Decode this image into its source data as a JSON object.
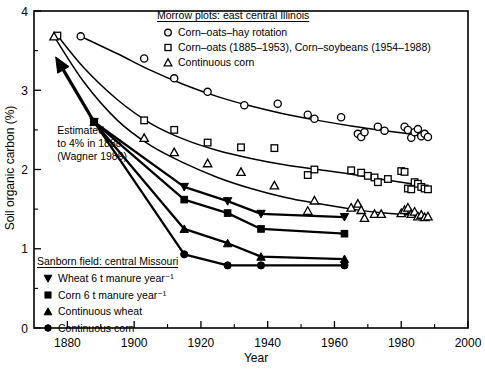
{
  "chart_data": {
    "type": "scatter",
    "title": "",
    "xlabel": "Year",
    "ylabel": "Soil organic carbon (%)",
    "xlim": [
      1870,
      2000
    ],
    "ylim": [
      0,
      4
    ],
    "xticks": [
      1880,
      1900,
      1920,
      1940,
      1960,
      1980,
      2000
    ],
    "xticklabels": [
      "1880",
      "1900",
      "1920",
      "1940",
      "1960",
      "1980",
      "2000"
    ],
    "xminorticks": [
      1870,
      1890,
      1910,
      1930,
      1950,
      1970,
      1990
    ],
    "yticks": [
      0,
      1,
      2,
      3,
      4
    ],
    "yticklabels": [
      "0",
      "1",
      "2",
      "3",
      "4"
    ],
    "yminorticks": [
      0.5,
      1.5,
      2.5,
      3.5
    ],
    "grid": false,
    "legend_position": "inside-top-right and inside-bottom-left",
    "annotations": [
      {
        "name": "estimated-note",
        "lines": [
          "Estimated",
          "to 4% in 1888",
          "(Wagner 1989)"
        ],
        "x": 1877,
        "y": 2.45
      }
    ],
    "arrow": {
      "name": "estimate-arrow",
      "from_x": 1888,
      "from_y": 2.6,
      "to_x": 1876.5,
      "to_y": 3.42
    },
    "series": [
      {
        "name": "Corn–oats–hay rotation",
        "group": "Morrow plots: east central Illinois",
        "marker": "circle-open",
        "fit": [
          [
            1884,
            3.68
          ],
          [
            1895,
            3.46
          ],
          [
            1905,
            3.25
          ],
          [
            1915,
            3.07
          ],
          [
            1925,
            2.92
          ],
          [
            1935,
            2.8
          ],
          [
            1945,
            2.7
          ],
          [
            1955,
            2.62
          ],
          [
            1965,
            2.55
          ],
          [
            1975,
            2.49
          ],
          [
            1988,
            2.42
          ]
        ],
        "points": [
          [
            1884,
            3.68
          ],
          [
            1903,
            3.4
          ],
          [
            1912,
            3.15
          ],
          [
            1922,
            2.98
          ],
          [
            1933,
            2.81
          ],
          [
            1943,
            2.83
          ],
          [
            1952,
            2.69
          ],
          [
            1954,
            2.64
          ],
          [
            1962,
            2.66
          ],
          [
            1967,
            2.45
          ],
          [
            1968,
            2.41
          ],
          [
            1969,
            2.47
          ],
          [
            1973,
            2.54
          ],
          [
            1975,
            2.49
          ],
          [
            1981,
            2.54
          ],
          [
            1982,
            2.5
          ],
          [
            1983,
            2.4
          ],
          [
            1984,
            2.47
          ],
          [
            1985,
            2.51
          ],
          [
            1986,
            2.42
          ],
          [
            1987,
            2.45
          ],
          [
            1988,
            2.41
          ]
        ]
      },
      {
        "name": "Corn–oats (1885–1953), Corn–soybeans (1954–1988)",
        "group": "Morrow plots: east central Illinois",
        "marker": "square-open",
        "fit": [
          [
            1877,
            3.69
          ],
          [
            1885,
            3.28
          ],
          [
            1895,
            2.88
          ],
          [
            1905,
            2.58
          ],
          [
            1915,
            2.38
          ],
          [
            1925,
            2.24
          ],
          [
            1935,
            2.14
          ],
          [
            1945,
            2.06
          ],
          [
            1955,
            2.0
          ],
          [
            1965,
            1.94
          ],
          [
            1975,
            1.87
          ],
          [
            1988,
            1.79
          ]
        ],
        "points": [
          [
            1877,
            3.69
          ],
          [
            1903,
            2.62
          ],
          [
            1912,
            2.5
          ],
          [
            1922,
            2.34
          ],
          [
            1932,
            2.28
          ],
          [
            1942,
            2.27
          ],
          [
            1952,
            1.93
          ],
          [
            1954,
            2.0
          ],
          [
            1965,
            1.99
          ],
          [
            1968,
            1.96
          ],
          [
            1970,
            1.92
          ],
          [
            1972,
            1.9
          ],
          [
            1973,
            1.84
          ],
          [
            1976,
            1.88
          ],
          [
            1980,
            1.98
          ],
          [
            1981,
            1.97
          ],
          [
            1982,
            1.76
          ],
          [
            1983,
            1.75
          ],
          [
            1984,
            1.84
          ],
          [
            1985,
            1.82
          ],
          [
            1986,
            1.78
          ],
          [
            1987,
            1.76
          ],
          [
            1988,
            1.75
          ]
        ]
      },
      {
        "name": "Continuous corn",
        "group": "Morrow plots: east central Illinois",
        "marker": "triangle-open",
        "fit": [
          [
            1876,
            3.68
          ],
          [
            1885,
            3.1
          ],
          [
            1895,
            2.62
          ],
          [
            1905,
            2.3
          ],
          [
            1915,
            2.08
          ],
          [
            1925,
            1.9
          ],
          [
            1935,
            1.76
          ],
          [
            1945,
            1.65
          ],
          [
            1955,
            1.57
          ],
          [
            1965,
            1.5
          ],
          [
            1975,
            1.45
          ],
          [
            1988,
            1.41
          ]
        ],
        "points": [
          [
            1876,
            3.68
          ],
          [
            1903,
            2.4
          ],
          [
            1912,
            2.22
          ],
          [
            1922,
            2.08
          ],
          [
            1932,
            1.97
          ],
          [
            1942,
            1.8
          ],
          [
            1954,
            1.61
          ],
          [
            1952,
            1.48
          ],
          [
            1965,
            1.52
          ],
          [
            1967,
            1.57
          ],
          [
            1968,
            1.49
          ],
          [
            1969,
            1.39
          ],
          [
            1972,
            1.44
          ],
          [
            1974,
            1.44
          ],
          [
            1980,
            1.45
          ],
          [
            1981,
            1.49
          ],
          [
            1982,
            1.52
          ],
          [
            1983,
            1.44
          ],
          [
            1984,
            1.47
          ],
          [
            1985,
            1.41
          ],
          [
            1986,
            1.43
          ],
          [
            1987,
            1.4
          ],
          [
            1988,
            1.41
          ]
        ]
      },
      {
        "name": "Wheat 6 t manure year⁻¹",
        "group": "Sanborn field: central Missouri",
        "marker": "triangle-down-solid",
        "connected": true,
        "points": [
          [
            1888,
            2.6
          ],
          [
            1915,
            1.78
          ],
          [
            1928,
            1.6
          ],
          [
            1938,
            1.44
          ],
          [
            1963,
            1.4
          ]
        ]
      },
      {
        "name": "Corn 6 t manure year⁻¹",
        "group": "Sanborn field: central Missouri",
        "marker": "square-solid",
        "connected": true,
        "points": [
          [
            1888,
            2.6
          ],
          [
            1915,
            1.62
          ],
          [
            1928,
            1.45
          ],
          [
            1938,
            1.25
          ],
          [
            1963,
            1.19
          ]
        ]
      },
      {
        "name": "Continuous wheat",
        "group": "Sanborn field: central Missouri",
        "marker": "triangle-up-solid",
        "connected": true,
        "points": [
          [
            1888,
            2.6
          ],
          [
            1915,
            1.25
          ],
          [
            1928,
            1.07
          ],
          [
            1938,
            0.9
          ],
          [
            1963,
            0.87
          ]
        ]
      },
      {
        "name": "Continuous corn",
        "group": "Sanborn field: central Missouri",
        "marker": "circle-solid",
        "connected": true,
        "points": [
          [
            1888,
            2.6
          ],
          [
            1915,
            0.93
          ],
          [
            1928,
            0.79
          ],
          [
            1938,
            0.79
          ],
          [
            1963,
            0.79
          ]
        ]
      }
    ]
  },
  "legend_top": {
    "name": "morrow-legend",
    "heading": "Morrow plots: east central Illinois",
    "items": [
      {
        "marker": "circle-open",
        "label": "Corn–oats–hay rotation"
      },
      {
        "marker": "square-open",
        "label": "Corn–oats (1885–1953), Corn–soybeans (1954–1988)"
      },
      {
        "marker": "triangle-open",
        "label": "Continuous corn"
      }
    ]
  },
  "legend_bottom": {
    "name": "sanborn-legend",
    "heading": "Sanborn field: central Missouri",
    "items": [
      {
        "marker": "triangle-down-solid",
        "label": "Wheat 6 t manure year⁻¹"
      },
      {
        "marker": "square-solid",
        "label": "Corn 6 t manure year⁻¹"
      },
      {
        "marker": "triangle-up-solid",
        "label": "Continuous wheat"
      },
      {
        "marker": "circle-solid",
        "label": "Continuous corn"
      }
    ]
  },
  "colors": {
    "ink": "#000000",
    "paper": "#ffffff"
  }
}
